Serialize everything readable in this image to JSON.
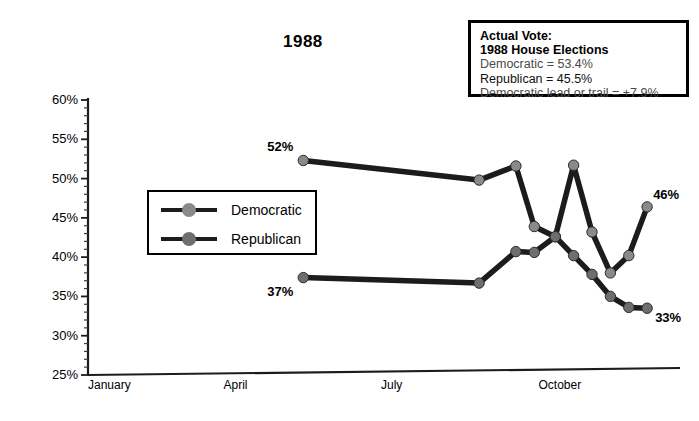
{
  "chart_data": {
    "type": "line",
    "title": "1988",
    "xlabel": "",
    "ylabel": "",
    "ylim": [
      25,
      60
    ],
    "ytick_labels": [
      "60%",
      "55%",
      "50%",
      "45%",
      "40%",
      "35%",
      "30%",
      "25%"
    ],
    "ytick_values": [
      60,
      55,
      50,
      45,
      40,
      35,
      30,
      25
    ],
    "minor_ticks": true,
    "grid": false,
    "legend_position": "inside-left",
    "xtick_labels": [
      "January",
      "April",
      "July",
      "October"
    ],
    "xtick_months": [
      1,
      4,
      7,
      10
    ],
    "x_unit": "month-of-1988",
    "series": [
      {
        "name": "Democratic",
        "color": "#8a8a8a",
        "x": [
          5.1,
          8.45,
          9.15,
          9.5,
          9.9,
          10.25,
          10.6,
          10.95,
          11.3,
          11.65
        ],
        "values": [
          52.3,
          49.8,
          51.6,
          43.9,
          42.6,
          51.7,
          43.2,
          38.0,
          40.2,
          46.4
        ],
        "first_label": "52%",
        "last_label": "46%"
      },
      {
        "name": "Republican",
        "color": "#6e6e6e",
        "x": [
          5.1,
          8.45,
          9.15,
          9.5,
          9.9,
          10.25,
          10.6,
          10.95,
          11.3,
          11.65
        ],
        "values": [
          37.4,
          36.7,
          40.7,
          40.6,
          42.6,
          40.2,
          37.8,
          35.0,
          33.6,
          33.5
        ],
        "first_label": "37%",
        "last_label": "33%"
      }
    ],
    "annotation": {
      "title_line_1": "Actual Vote:",
      "title_line_2": "1988 House Elections",
      "rows": [
        "Democratic = 53.4%",
        "Republican = 45.5%",
        "Democratic lead or trail = +7.9%"
      ]
    }
  },
  "axis": {
    "line_color": "#1c1c1c"
  }
}
